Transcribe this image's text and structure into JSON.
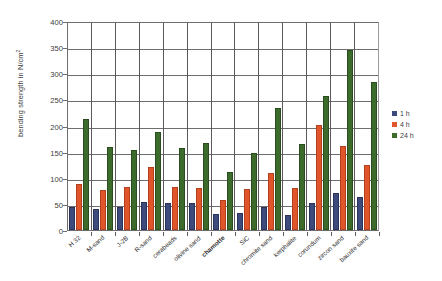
{
  "chart_data": {
    "type": "bar",
    "title": "",
    "xlabel": "",
    "ylabel": "bending strength in N/cm²",
    "ylabel_base": "bending strength in N/cm",
    "ylabel_sup": "2",
    "ylim": [
      0,
      400
    ],
    "yticks": [
      0,
      50,
      100,
      150,
      200,
      250,
      300,
      350,
      400
    ],
    "grid": true,
    "legend_position": "right",
    "categories": [
      "H 32",
      "M-sand",
      "J-2B",
      "R-sand",
      "cerabeads",
      "olivine sand",
      "chamotte",
      "SiC",
      "chromite sand",
      "kerphalite",
      "corundum",
      "zircon sand",
      "bauxite sand"
    ],
    "bold_categories": [
      "chamotte"
    ],
    "series": [
      {
        "name": "1 h",
        "color": "#3c4a7c",
        "values": [
          45,
          40,
          44,
          53,
          52,
          52,
          30,
          33,
          44,
          28,
          52,
          70,
          63
        ]
      },
      {
        "name": "4 h",
        "color": "#e1552b",
        "values": [
          88,
          76,
          83,
          120,
          82,
          80,
          57,
          79,
          110,
          80,
          201,
          160,
          124
        ]
      },
      {
        "name": "24 h",
        "color": "#3d6b2b",
        "values": [
          212,
          158,
          154,
          188,
          157,
          167,
          111,
          148,
          233,
          165,
          257,
          345,
          283
        ]
      }
    ]
  },
  "legend": {
    "items": [
      {
        "label": "1 h",
        "color": "#3c4a7c"
      },
      {
        "label": "4 h",
        "color": "#e1552b"
      },
      {
        "label": "24 h",
        "color": "#3d6b2b"
      }
    ]
  }
}
